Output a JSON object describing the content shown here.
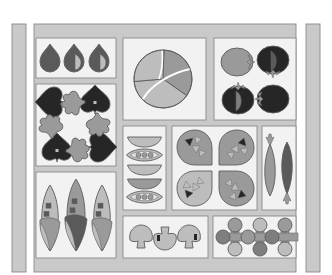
{
  "canvas": {
    "width": 332,
    "height": 275,
    "background": "#ffffff"
  },
  "palette": {
    "frame": "#c9c9c9",
    "frame_stroke": "#8a8a8a",
    "panel_bg": "#f2f2f2",
    "panel_bg_alt": "#ebebeb",
    "light": "#bdbdbd",
    "mid": "#9a9a9a",
    "midDark": "#7e7e7e",
    "dark": "#5a5a5a",
    "darkest": "#262626",
    "outline": "#5e5e5e"
  },
  "strips": [
    {
      "name": "left-outer-strip",
      "x": 12,
      "y": 24,
      "w": 14,
      "h": 248
    },
    {
      "name": "right-outer-strip",
      "x": 306,
      "y": 24,
      "w": 14,
      "h": 248
    }
  ],
  "frame": {
    "x": 34,
    "y": 24,
    "w": 262,
    "h": 248
  },
  "panels": [
    {
      "name": "panel-drops",
      "x": 36,
      "y": 38,
      "w": 80,
      "h": 40
    },
    {
      "name": "panel-hearts",
      "x": 36,
      "y": 84,
      "w": 80,
      "h": 82
    },
    {
      "name": "panel-leaves",
      "x": 36,
      "y": 172,
      "w": 80,
      "h": 86
    },
    {
      "name": "panel-pie",
      "x": 123,
      "y": 38,
      "w": 83,
      "h": 82
    },
    {
      "name": "panel-tomatoes",
      "x": 214,
      "y": 38,
      "w": 82,
      "h": 82
    },
    {
      "name": "panel-bowls",
      "x": 123,
      "y": 126,
      "w": 43,
      "h": 84
    },
    {
      "name": "panel-leaf-tiles",
      "x": 172,
      "y": 126,
      "w": 85,
      "h": 84
    },
    {
      "name": "panel-fish",
      "x": 262,
      "y": 126,
      "w": 34,
      "h": 84
    },
    {
      "name": "panel-mushrooms",
      "x": 123,
      "y": 216,
      "w": 85,
      "h": 42
    },
    {
      "name": "panel-circles",
      "x": 213,
      "y": 216,
      "w": 83,
      "h": 42
    }
  ],
  "drops": [
    {
      "cx": 50,
      "cy": 58,
      "fill": "dark",
      "half": null
    },
    {
      "cx": 74,
      "cy": 58,
      "fill": "dark",
      "half": "light"
    },
    {
      "cx": 99,
      "cy": 58,
      "fill": "dark",
      "half": "light"
    }
  ],
  "hearts": [
    {
      "cx": 50,
      "cy": 102,
      "rot": -90,
      "dot": false
    },
    {
      "cx": 95,
      "cy": 100,
      "rot": 0,
      "dot": true
    },
    {
      "cx": 57,
      "cy": 148,
      "rot": 0,
      "dot": true
    },
    {
      "cx": 102,
      "cy": 147,
      "rot": 90,
      "dot": false
    }
  ],
  "sprigs": [
    {
      "cx": 73,
      "cy": 103,
      "rot": -90
    },
    {
      "cx": 51,
      "cy": 126,
      "rot": 0
    },
    {
      "cx": 98,
      "cy": 125,
      "rot": 180
    },
    {
      "cx": 78,
      "cy": 150,
      "rot": 90
    }
  ],
  "leaves": [
    {
      "cx": 50,
      "cy": 218,
      "rx": 11,
      "ry": 33,
      "topFill": "light",
      "bottomFill": "mid",
      "accent": "light"
    },
    {
      "cx": 76,
      "cy": 215,
      "rx": 12,
      "ry": 36,
      "topFill": "mid",
      "bottomFill": "dark",
      "accent": "light"
    },
    {
      "cx": 102,
      "cy": 218,
      "rx": 11,
      "ry": 33,
      "topFill": "light",
      "bottomFill": "mid",
      "accent": "light"
    }
  ],
  "pie": {
    "cx": 163,
    "cy": 79,
    "r": 29,
    "slices": [
      {
        "from": -88,
        "to": 35,
        "fill": "mid"
      },
      {
        "from": 35,
        "to": 175,
        "fill": "light"
      },
      {
        "from": 175,
        "to": 272,
        "fill": "light"
      }
    ]
  },
  "tomatoes": [
    {
      "cx": 237,
      "cy": 62,
      "fill": "mid",
      "cut": null,
      "stem": "right"
    },
    {
      "cx": 273,
      "cy": 60,
      "fill": "darkest",
      "cut": "dark",
      "stem": "bottom"
    },
    {
      "cx": 238,
      "cy": 100,
      "fill": "darkest",
      "cut": "midDark",
      "stem": "top"
    },
    {
      "cx": 273,
      "cy": 99,
      "fill": "darkest",
      "cut": null,
      "stem": "left"
    }
  ],
  "bowls": [
    {
      "type": "half",
      "cy": 141,
      "fill": "light"
    },
    {
      "type": "pod",
      "cy": 155,
      "fill": "light",
      "peas": "mid"
    },
    {
      "type": "half",
      "cy": 169,
      "fill": "light"
    },
    {
      "type": "half",
      "cy": 183,
      "fill": "mid"
    },
    {
      "type": "pod",
      "cy": 197,
      "fill": "light",
      "peas": "mid"
    }
  ],
  "leaf_tiles": [
    {
      "cx": 195,
      "cy": 148,
      "rot": 0,
      "fill": "mid"
    },
    {
      "cx": 236,
      "cy": 148,
      "rot": 90,
      "fill": "mid"
    },
    {
      "cx": 195,
      "cy": 188,
      "rot": -90,
      "fill": "light"
    },
    {
      "cx": 236,
      "cy": 188,
      "rot": 180,
      "fill": "mid"
    }
  ],
  "fish": [
    {
      "cx": 270,
      "cy": 170,
      "fill": "mid",
      "tail": "top"
    },
    {
      "cx": 287,
      "cy": 168,
      "fill": "dark",
      "tail": "bottom"
    }
  ],
  "mushrooms": [
    {
      "cx": 141,
      "cy": 237,
      "fill": "light",
      "gill": false,
      "flip": false
    },
    {
      "cx": 165,
      "cy": 238,
      "fill": "light",
      "gill": true,
      "flip": true
    },
    {
      "cx": 189,
      "cy": 237,
      "fill": "light",
      "gill": true,
      "flip": false
    }
  ],
  "circles": [
    {
      "cx": 235,
      "cy": 225,
      "fill": "mid"
    },
    {
      "cx": 260,
      "cy": 225,
      "fill": "light"
    },
    {
      "cx": 285,
      "cy": 225,
      "fill": "mid"
    },
    {
      "cx": 223,
      "cy": 237,
      "fill": "midDark"
    },
    {
      "cx": 248,
      "cy": 237,
      "fill": "mid"
    },
    {
      "cx": 272,
      "cy": 237,
      "fill": "midDark"
    },
    {
      "cx": 235,
      "cy": 249,
      "fill": "light"
    },
    {
      "cx": 260,
      "cy": 249,
      "fill": "midDark"
    },
    {
      "cx": 285,
      "cy": 249,
      "fill": "light"
    }
  ],
  "crosses": [
    {
      "cx": 235,
      "cy": 237
    },
    {
      "cx": 260,
      "cy": 237
    },
    {
      "cx": 285,
      "cy": 237
    }
  ]
}
